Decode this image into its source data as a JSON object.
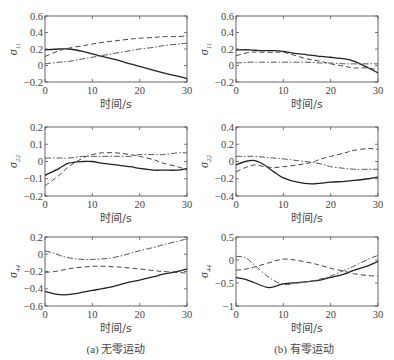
{
  "captions": {
    "left": "(a) 无零运动",
    "right": "(b) 有零运动"
  },
  "chart_data": [
    {
      "type": "line",
      "panel": "a",
      "row": 1,
      "ylabel": "σ11",
      "xlabel": "时间/s",
      "xlim": [
        0,
        30
      ],
      "ylim": [
        -0.2,
        0.6
      ],
      "xticks": [
        0,
        10,
        20,
        30
      ],
      "yticks": [
        -0.2,
        0,
        0.2,
        0.4,
        0.6
      ],
      "x": [
        0,
        3,
        5,
        8,
        10,
        12,
        15,
        18,
        20,
        23,
        25,
        28,
        30
      ],
      "series": [
        {
          "name": "solid",
          "style": "solid",
          "values": [
            0.19,
            0.2,
            0.2,
            0.17,
            0.14,
            0.11,
            0.07,
            0.02,
            -0.01,
            -0.06,
            -0.09,
            -0.13,
            -0.16
          ]
        },
        {
          "name": "dashed",
          "style": "dashed",
          "values": [
            0.11,
            0.18,
            0.21,
            0.24,
            0.26,
            0.28,
            0.3,
            0.32,
            0.33,
            0.34,
            0.35,
            0.35,
            0.36
          ]
        },
        {
          "name": "dashdot",
          "style": "dashdot",
          "values": [
            0.02,
            0.04,
            0.05,
            0.08,
            0.1,
            0.12,
            0.15,
            0.18,
            0.2,
            0.22,
            0.24,
            0.26,
            0.27
          ]
        }
      ]
    },
    {
      "type": "line",
      "panel": "b",
      "row": 1,
      "ylabel": "σ11",
      "xlabel": "时间/s",
      "xlim": [
        0,
        30
      ],
      "ylim": [
        -0.2,
        0.6
      ],
      "xticks": [
        0,
        10,
        20,
        30
      ],
      "yticks": [
        -0.2,
        0,
        0.2,
        0.4,
        0.6
      ],
      "x": [
        0,
        3,
        5,
        8,
        10,
        12,
        15,
        18,
        20,
        23,
        25,
        28,
        30
      ],
      "series": [
        {
          "name": "solid",
          "style": "solid",
          "values": [
            0.19,
            0.19,
            0.18,
            0.18,
            0.17,
            0.15,
            0.13,
            0.11,
            0.1,
            0.08,
            0.05,
            -0.03,
            -0.09
          ]
        },
        {
          "name": "dashed",
          "style": "dashed",
          "values": [
            0.12,
            0.16,
            0.16,
            0.16,
            0.16,
            0.13,
            0.08,
            0.05,
            0.02,
            -0.01,
            -0.03,
            -0.03,
            -0.06
          ]
        },
        {
          "name": "dashdot",
          "style": "dashdot",
          "values": [
            0.03,
            0.04,
            0.04,
            0.04,
            0.04,
            0.04,
            0.04,
            0.03,
            0.03,
            0.02,
            0.02,
            0.02,
            0.02
          ]
        }
      ]
    },
    {
      "type": "line",
      "panel": "a",
      "row": 2,
      "ylabel": "σ22",
      "xlabel": "时间/s",
      "xlim": [
        0,
        30
      ],
      "ylim": [
        -0.2,
        0.2
      ],
      "xticks": [
        0,
        10,
        20,
        30
      ],
      "yticks": [
        -0.2,
        -0.1,
        0,
        0.1,
        0.2
      ],
      "x": [
        0,
        3,
        5,
        8,
        10,
        12,
        15,
        18,
        20,
        23,
        25,
        28,
        30
      ],
      "series": [
        {
          "name": "solid",
          "style": "solid",
          "values": [
            -0.08,
            -0.04,
            -0.01,
            0.0,
            0.0,
            -0.01,
            -0.02,
            -0.03,
            -0.04,
            -0.05,
            -0.05,
            -0.05,
            -0.04
          ]
        },
        {
          "name": "dashed",
          "style": "dashed",
          "values": [
            -0.14,
            -0.08,
            -0.03,
            0.02,
            0.04,
            0.05,
            0.05,
            0.04,
            0.03,
            0.01,
            -0.01,
            -0.03,
            -0.05
          ]
        },
        {
          "name": "dashdot",
          "style": "dashdot",
          "values": [
            0.02,
            0.02,
            0.02,
            0.03,
            0.03,
            0.03,
            0.03,
            0.03,
            0.04,
            0.04,
            0.04,
            0.05,
            0.05
          ]
        }
      ]
    },
    {
      "type": "line",
      "panel": "b",
      "row": 2,
      "ylabel": "σ22",
      "xlabel": "时间/s",
      "xlim": [
        0,
        30
      ],
      "ylim": [
        -0.4,
        0.4
      ],
      "xticks": [
        0,
        10,
        20,
        30
      ],
      "yticks": [
        -0.4,
        -0.2,
        0,
        0.2,
        0.4
      ],
      "x": [
        0,
        2,
        4,
        6,
        8,
        10,
        13,
        16,
        18,
        20,
        23,
        25,
        28,
        30
      ],
      "series": [
        {
          "name": "solid",
          "style": "solid",
          "values": [
            -0.04,
            0.0,
            0.01,
            -0.04,
            -0.12,
            -0.19,
            -0.24,
            -0.26,
            -0.25,
            -0.24,
            -0.23,
            -0.22,
            -0.2,
            -0.18
          ]
        },
        {
          "name": "dashed",
          "style": "dashed",
          "values": [
            -0.12,
            -0.07,
            -0.04,
            -0.06,
            -0.07,
            -0.06,
            -0.04,
            -0.01,
            0.03,
            0.06,
            0.1,
            0.13,
            0.15,
            0.14
          ]
        },
        {
          "name": "dashdot",
          "style": "dashdot",
          "values": [
            0.06,
            0.06,
            0.06,
            0.05,
            0.04,
            0.03,
            0.01,
            -0.01,
            -0.03,
            -0.06,
            -0.08,
            -0.09,
            -0.09,
            -0.09
          ]
        }
      ]
    },
    {
      "type": "line",
      "panel": "a",
      "row": 3,
      "ylabel": "σ44",
      "xlabel": "时间/s",
      "xlim": [
        0,
        30
      ],
      "ylim": [
        -0.6,
        0.2
      ],
      "xticks": [
        0,
        10,
        20,
        30
      ],
      "yticks": [
        -0.6,
        -0.4,
        -0.2,
        0,
        0.2
      ],
      "x": [
        0,
        2,
        4,
        6,
        8,
        10,
        13,
        16,
        18,
        20,
        23,
        25,
        28,
        30
      ],
      "series": [
        {
          "name": "solid",
          "style": "solid",
          "values": [
            -0.43,
            -0.46,
            -0.47,
            -0.46,
            -0.44,
            -0.42,
            -0.39,
            -0.35,
            -0.32,
            -0.3,
            -0.26,
            -0.23,
            -0.2,
            -0.17
          ]
        },
        {
          "name": "dashed",
          "style": "dashed",
          "values": [
            -0.21,
            -0.2,
            -0.18,
            -0.16,
            -0.15,
            -0.14,
            -0.14,
            -0.15,
            -0.16,
            -0.17,
            -0.19,
            -0.2,
            -0.21,
            -0.22
          ]
        },
        {
          "name": "dashdot",
          "style": "dashdot",
          "values": [
            0.04,
            0.01,
            -0.03,
            -0.05,
            -0.06,
            -0.06,
            -0.05,
            -0.02,
            0.01,
            0.04,
            0.08,
            0.11,
            0.15,
            0.18
          ]
        }
      ]
    },
    {
      "type": "line",
      "panel": "b",
      "row": 3,
      "ylabel": "σ44",
      "xlabel": "时间/s",
      "xlim": [
        0,
        30
      ],
      "ylim": [
        -1,
        0.5
      ],
      "xticks": [
        0,
        10,
        20,
        30
      ],
      "yticks": [
        -1,
        -0.5,
        0,
        0.5
      ],
      "x": [
        0,
        2,
        4,
        7,
        10,
        13,
        16,
        18,
        20,
        23,
        25,
        28,
        30
      ],
      "series": [
        {
          "name": "solid",
          "style": "solid",
          "values": [
            -0.38,
            -0.42,
            -0.5,
            -0.6,
            -0.52,
            -0.49,
            -0.46,
            -0.43,
            -0.38,
            -0.3,
            -0.22,
            -0.12,
            -0.03
          ]
        },
        {
          "name": "dashed",
          "style": "dashed",
          "values": [
            -0.22,
            -0.2,
            -0.15,
            -0.06,
            0.02,
            -0.01,
            -0.07,
            -0.12,
            -0.18,
            -0.25,
            -0.3,
            -0.34,
            -0.35
          ]
        },
        {
          "name": "dashdot",
          "style": "dashdot",
          "values": [
            0.08,
            0.05,
            -0.12,
            -0.38,
            -0.53,
            -0.5,
            -0.46,
            -0.41,
            -0.35,
            -0.22,
            -0.13,
            0.02,
            0.1
          ]
        }
      ]
    }
  ]
}
